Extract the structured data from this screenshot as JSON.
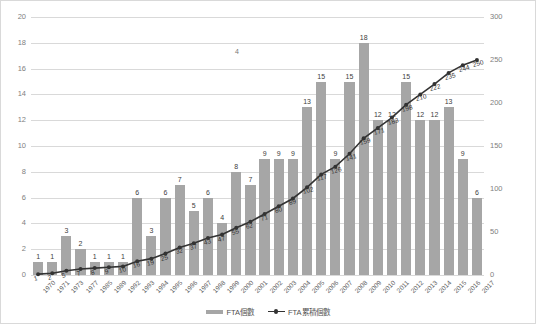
{
  "chart_data": {
    "type": "bar",
    "title": "",
    "subtitle": "",
    "xlabel": "",
    "ylabel": "",
    "y2label": "",
    "grid": true,
    "legend_position": "bottom",
    "categories": [
      "1970",
      "1971",
      "1973",
      "1977",
      "1985",
      "1989",
      "1992",
      "1993",
      "1994",
      "1995",
      "1996",
      "1997",
      "1998",
      "1999",
      "2000",
      "2001",
      "2002",
      "2003",
      "2004",
      "2005",
      "2006",
      "2007",
      "2008",
      "2009",
      "2010",
      "2011",
      "2012",
      "2013",
      "2014",
      "2015",
      "2016",
      "2017"
    ],
    "series": [
      {
        "name": "FTA個數",
        "type": "bar",
        "axis": "left",
        "color": "#a6a6a6",
        "values": [
          1,
          1,
          3,
          2,
          1,
          1,
          1,
          6,
          3,
          6,
          7,
          5,
          6,
          4,
          8,
          7,
          9,
          9,
          9,
          13,
          15,
          9,
          15,
          18,
          12,
          12,
          15,
          12,
          12,
          13,
          9,
          6
        ]
      },
      {
        "name": "FTA累積個數",
        "type": "line",
        "axis": "right",
        "color": "#333333",
        "values": [
          1,
          2,
          5,
          7,
          8,
          9,
          10,
          16,
          19,
          25,
          32,
          37,
          43,
          47,
          55,
          62,
          71,
          80,
          89,
          102,
          117,
          126,
          141,
          159,
          171,
          183,
          198,
          210,
          222,
          235,
          244,
          250
        ]
      }
    ],
    "ylim": [
      0,
      20
    ],
    "yticks": [
      0,
      2,
      4,
      6,
      8,
      10,
      12,
      14,
      16,
      18,
      20
    ],
    "y2lim": [
      0,
      300
    ],
    "y2ticks": [
      0,
      50,
      100,
      150,
      200,
      250,
      300
    ],
    "annotations": [
      "4"
    ]
  },
  "legend": {
    "items": [
      {
        "label": "FTA個數"
      },
      {
        "label": "FTA累積個數"
      }
    ]
  }
}
